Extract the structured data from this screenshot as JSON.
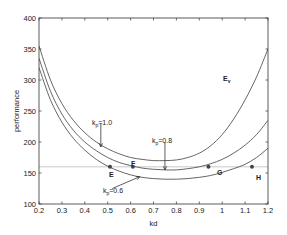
{
  "chart_data": {
    "type": "line",
    "title": "",
    "xlabel": "kd",
    "ylabel": "performance",
    "xlim": [
      0.2,
      1.2
    ],
    "ylim": [
      100,
      400
    ],
    "grid": false,
    "legend": "none",
    "x_ticks": [
      0.2,
      0.3,
      0.4,
      0.5,
      0.6,
      0.7,
      0.8,
      0.9,
      1,
      1.1,
      1.2
    ],
    "y_ticks": [
      100,
      150,
      200,
      250,
      300,
      350,
      400
    ],
    "x_tick_labels": [
      "0.2",
      "0.3",
      "0.4",
      "0.5",
      "0.6",
      "0.7",
      "0.8",
      "0.9",
      "1",
      "1.1",
      "1.2"
    ],
    "y_tick_labels": [
      "100",
      "150",
      "200",
      "250",
      "300",
      "350",
      "400"
    ],
    "x": [
      0.2,
      0.25,
      0.3,
      0.35,
      0.4,
      0.45,
      0.5,
      0.55,
      0.6,
      0.65,
      0.7,
      0.75,
      0.8,
      0.85,
      0.9,
      0.95,
      1.0,
      1.05,
      1.1,
      1.15,
      1.2
    ],
    "series": [
      {
        "name": "k_p=1.0",
        "values": [
          355,
          300,
          262,
          235,
          215,
          200,
          189,
          181,
          175,
          172,
          170,
          170,
          171,
          175,
          182,
          194,
          212,
          237,
          268,
          305,
          350
        ]
      },
      {
        "name": "k_p=0.8",
        "values": [
          335,
          282,
          245,
          219,
          200,
          186,
          175,
          167,
          162,
          158,
          156,
          155,
          155,
          157,
          160,
          165,
          172,
          182,
          195,
          212,
          235
        ]
      },
      {
        "name": "k_p=0.6",
        "values": [
          320,
          268,
          232,
          206,
          187,
          172,
          161,
          153,
          147,
          143,
          141,
          140,
          140,
          141,
          143,
          146,
          151,
          157,
          164,
          175,
          190
        ]
      }
    ],
    "reference_line": {
      "y": 160,
      "label": ""
    },
    "points": [
      {
        "label": "E",
        "x": 0.51,
        "y": 160
      },
      {
        "label": "F",
        "x": 0.61,
        "y": 160
      },
      {
        "label": "G",
        "x": 0.94,
        "y": 160
      },
      {
        "label": "H",
        "x": 1.13,
        "y": 160
      }
    ],
    "annotations": [
      {
        "text": "k_p=1.0",
        "x": 0.47,
        "y": 230,
        "arrow_to": [
          0.47,
          192
        ]
      },
      {
        "text": "k_p=0.8",
        "x": 0.75,
        "y": 200,
        "arrow_to": [
          0.75,
          155
        ]
      },
      {
        "text": "k_p=0.6",
        "x": 0.52,
        "y": 125,
        "arrow_to": [
          0.64,
          144
        ]
      },
      {
        "text": "E_v",
        "x": 0.98,
        "y": 290
      }
    ]
  },
  "labels": {
    "xlabel": "kd",
    "ylabel": "performance",
    "kp10": "k",
    "kp10_sub": "p",
    "kp10_val": "=1.0",
    "kp08": "k",
    "kp08_sub": "p",
    "kp08_val": "=0.8",
    "kp06": "k",
    "kp06_sub": "p",
    "kp06_val": "=0.6",
    "ev": "E",
    "ev_sub": "v",
    "E": "E",
    "F": "F",
    "G": "G",
    "H": "H"
  },
  "colors": {
    "curve": "#555555",
    "axis": "#333333",
    "refline": "#bbbbbb",
    "point": "#444444"
  }
}
